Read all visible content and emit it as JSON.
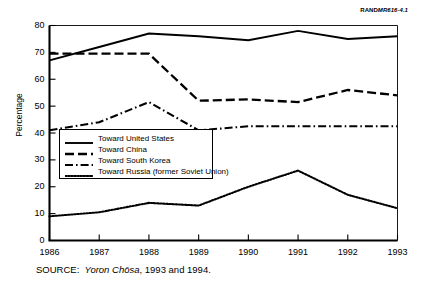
{
  "figure": {
    "rand_id_prefix": "RAND",
    "rand_id_suffix": "MR616-4.1",
    "source_prefix": "SOURCE:",
    "source_italic": "Yoron Chōsa",
    "source_rest": ", 1993 and 1994."
  },
  "legend": {
    "items": [
      {
        "label": "Toward United States",
        "style": "solid"
      },
      {
        "label": "Toward China",
        "style": "dashed"
      },
      {
        "label": "Toward South Korea",
        "style": "dashdot"
      },
      {
        "label": "Toward Russia (former Soviet Union)",
        "style": "dotted"
      }
    ]
  },
  "chart_data": {
    "type": "line",
    "title": "",
    "xlabel": "",
    "ylabel": "Percentage",
    "x": [
      1986,
      1987,
      1988,
      1989,
      1990,
      1991,
      1992,
      1993
    ],
    "xtick_labels": [
      "1986",
      "1987",
      "1988",
      "1989",
      "1990",
      "1991",
      "1992",
      "1993"
    ],
    "ytick_labels": [
      "0",
      "10",
      "20",
      "30",
      "40",
      "50",
      "60",
      "70",
      "80"
    ],
    "yticks": [
      0,
      10,
      20,
      30,
      40,
      50,
      60,
      70,
      80
    ],
    "ylim": [
      0,
      80
    ],
    "xlim": [
      1986,
      1993
    ],
    "grid": false,
    "legend_position": "inside-lower-left",
    "series": [
      {
        "name": "Toward United States",
        "style": "solid",
        "color": "#000000",
        "values": [
          67,
          72,
          77,
          76,
          74.5,
          78,
          75,
          76
        ]
      },
      {
        "name": "Toward China",
        "style": "dashed",
        "color": "#000000",
        "values": [
          69.5,
          69.5,
          69.5,
          52,
          52.5,
          51.5,
          56,
          54
        ]
      },
      {
        "name": "Toward South Korea",
        "style": "dashdot",
        "color": "#000000",
        "values": [
          41,
          44,
          51.5,
          41,
          42.5,
          42.5,
          42.5,
          42.5
        ]
      },
      {
        "name": "Toward Russia (former Soviet Union)",
        "style": "dotted",
        "color": "#000000",
        "values": [
          9,
          10.5,
          14,
          13,
          20,
          26,
          17,
          12
        ]
      }
    ]
  }
}
